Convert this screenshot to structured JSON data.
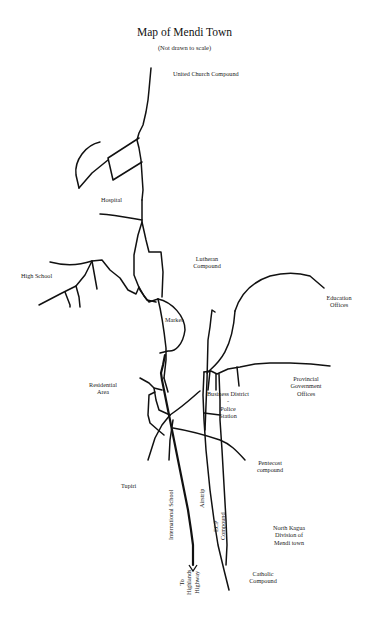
{
  "map": {
    "title": "Map of Mendi Town",
    "subtitle": "(Not drawn to scale)",
    "labels": {
      "united_church": "United Church Compound",
      "hospital": "Hospital",
      "lutheran_1": "Lutheran",
      "lutheran_2": "Compound",
      "high_school": "High School",
      "education_1": "Education",
      "education_2": "Offices",
      "market": "Market",
      "residential_1": "Residential",
      "residential_2": "Area",
      "business_district": "Business District",
      "dash": "-",
      "police_1": "Police",
      "police_2": "Station",
      "provincial_1": "Provincial",
      "provincial_2": "Government",
      "provincial_3": "Offices",
      "pentecost_1": "Pentecost",
      "pentecost_2": "compound",
      "tupiri": "Tupiri",
      "international_school": "International School",
      "airstrip": "Airstrip",
      "ecp_1": "ECP",
      "ecp_2": "Compound",
      "north_kagua_1": "North Kagua",
      "north_kagua_2": "Division of",
      "north_kagua_3": "Mendi town",
      "catholic_1": "Catholic",
      "catholic_2": "Compound",
      "highway_1": "To",
      "highway_2": "Highlands",
      "highway_3": "Highway"
    },
    "icons": {
      "highway_arrow": "arrow-down-icon"
    }
  }
}
